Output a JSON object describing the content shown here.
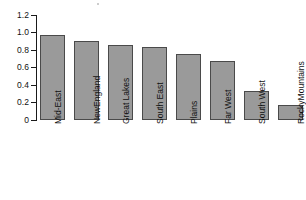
{
  "chart_data": {
    "type": "bar",
    "title": "",
    "subtitle": "",
    "xlabel": "",
    "ylabel": "",
    "ylim": [
      0,
      1.2
    ],
    "yticks": [
      0,
      0.2,
      0.4,
      0.6,
      0.8,
      1.0,
      1.2
    ],
    "ytick_labels": [
      "0",
      "0.2",
      "0.4",
      "0.6",
      "0.8",
      "1.0",
      "1.2"
    ],
    "grid": false,
    "legend": null,
    "bar_color": "#9a9a9a",
    "bar_edge_color": "#4a4a4a",
    "axis_color": "#1a1a1a",
    "categories": [
      "Mid-East",
      "New England",
      "Great Lakes",
      "South East",
      "Plains",
      "Far West",
      "South West",
      "Rocky Mountains"
    ],
    "category_lines": [
      [
        "Mid-East"
      ],
      [
        "New",
        "England"
      ],
      [
        "Great Lakes"
      ],
      [
        "South East"
      ],
      [
        "Plains"
      ],
      [
        "Far West"
      ],
      [
        "South West"
      ],
      [
        "Rocky",
        "Mountains"
      ]
    ],
    "values": [
      0.97,
      0.9,
      0.86,
      0.83,
      0.75,
      0.67,
      0.33,
      0.17
    ]
  }
}
